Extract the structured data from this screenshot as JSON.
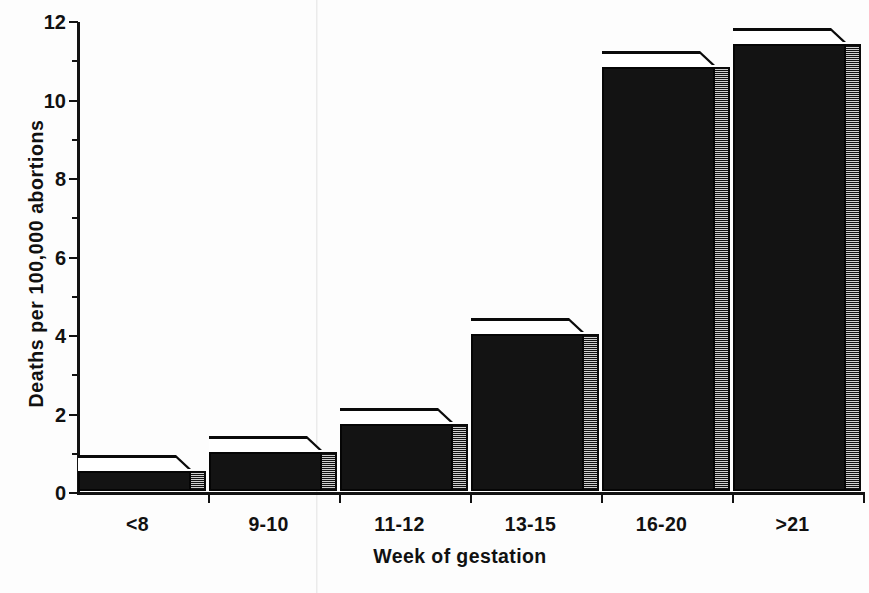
{
  "chart_data": {
    "type": "bar",
    "title": "",
    "xlabel": "Week of gestation",
    "ylabel": "Deaths per 100,000  abortions",
    "categories": [
      "<8",
      "9-10",
      "11-12",
      "13-15",
      "16-20",
      ">21"
    ],
    "values": [
      0.5,
      1.0,
      1.7,
      4.0,
      10.8,
      11.4
    ],
    "ylim": [
      0,
      12
    ],
    "y_major_ticks": [
      0,
      2,
      4,
      6,
      8,
      10,
      12
    ],
    "y_minor_ticks": [
      1,
      3,
      5,
      7,
      9,
      11
    ],
    "y_tick_labels": [
      "0",
      "2",
      "4",
      "6",
      "8",
      "10",
      "12"
    ],
    "grid": false,
    "legend": false,
    "style": "3d-block-bars",
    "colors": {
      "bar_front": "#131313",
      "bar_top": "#ffffff",
      "bar_side": "#3c3c3c",
      "axis": "#121212",
      "text": "#111111",
      "background": "#fdfdfd"
    }
  }
}
